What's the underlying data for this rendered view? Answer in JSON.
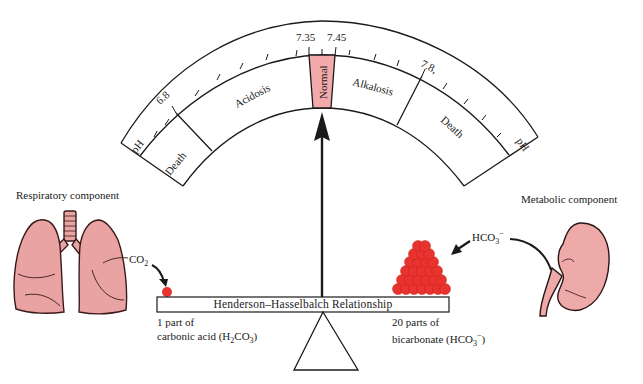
{
  "gauge": {
    "title": "pH scale",
    "end_labels": {
      "left": "pH",
      "right": "pH"
    },
    "ticks": {
      "6.8": "6.8",
      "7.35": "7.35",
      "7.45": "7.45",
      "7.8": "7.8,"
    },
    "zones": [
      {
        "name": "death-acid",
        "label": "Death"
      },
      {
        "name": "acidosis",
        "label": "Acidosis"
      },
      {
        "name": "normal",
        "label": "Normal",
        "color": "#f2aaaa"
      },
      {
        "name": "alkalosis",
        "label": "Alkalosis"
      },
      {
        "name": "death-alkali",
        "label": "Death"
      }
    ],
    "pointer": "Normal"
  },
  "respiratory": {
    "title": "Respiratory component",
    "gas_label": "CO",
    "gas_sub": "2",
    "organ": "lungs",
    "organ_color": "#e9a3a3"
  },
  "metabolic": {
    "title": "Metabolic component",
    "ion_label": "HCO",
    "ion_sub": "3",
    "ion_sup": "−",
    "organ": "kidney",
    "organ_color": "#eea9a9"
  },
  "balance": {
    "beam_label": "Henderson–Hasselbalch Relationship",
    "left_caption_line1": "1 part of",
    "left_caption_line2_pre": "carbonic acid (H",
    "left_caption_sub1": "2",
    "left_caption_mid": "CO",
    "left_caption_sub2": "3",
    "left_caption_post": ")",
    "right_caption_line1": "20 parts of",
    "right_caption_line2_pre": "bicarbonate (HCO",
    "right_caption_sub": "3",
    "right_caption_sup": "−",
    "right_caption_post": ")",
    "ratio_left": 1,
    "ratio_right": 20,
    "ball_color": "#e8332e"
  }
}
